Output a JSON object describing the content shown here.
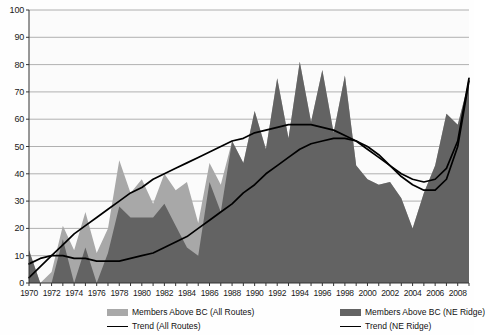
{
  "chart_data": {
    "type": "area",
    "title": "",
    "subtitle": "",
    "xlabel": "",
    "ylabel": "",
    "xlim": [
      1970,
      2009
    ],
    "ylim": [
      0,
      100
    ],
    "ytick_step": 10,
    "grid": true,
    "legend_position": "bottom",
    "yticks": [
      0,
      10,
      20,
      30,
      40,
      50,
      60,
      70,
      80,
      90,
      100
    ],
    "xticks": [
      1970,
      1972,
      1974,
      1976,
      1978,
      1980,
      1982,
      1984,
      1986,
      1988,
      1990,
      1992,
      1994,
      1996,
      1998,
      2000,
      2002,
      2004,
      2006,
      2008
    ],
    "x": [
      1970,
      1971,
      1972,
      1973,
      1974,
      1975,
      1976,
      1977,
      1978,
      1979,
      1980,
      1981,
      1982,
      1983,
      1984,
      1985,
      1986,
      1987,
      1988,
      1989,
      1990,
      1991,
      1992,
      1993,
      1994,
      1995,
      1996,
      1997,
      1998,
      1999,
      2000,
      2001,
      2002,
      2003,
      2004,
      2005,
      2006,
      2007,
      2008,
      2009
    ],
    "series": [
      {
        "name": "Members Above BC (All Routes)",
        "key": "all_routes",
        "color": "#a8a8a8",
        "kind": "area",
        "values": [
          12,
          0,
          4,
          21,
          12,
          26,
          11,
          20,
          45,
          33,
          38,
          29,
          40,
          34,
          37,
          22,
          44,
          36,
          52,
          44,
          63,
          49,
          75,
          53,
          81,
          59,
          78,
          55,
          76,
          43,
          38,
          36,
          37,
          31,
          20,
          33,
          43,
          62,
          58,
          74
        ]
      },
      {
        "name": "Members Above BC (NE Ridge)",
        "key": "ne_ridge",
        "color": "#636363",
        "kind": "area",
        "values": [
          12,
          0,
          0,
          16,
          0,
          13,
          0,
          11,
          28,
          24,
          24,
          24,
          29,
          21,
          13,
          10,
          37,
          26,
          52,
          44,
          63,
          49,
          75,
          53,
          81,
          59,
          78,
          55,
          76,
          43,
          38,
          36,
          37,
          31,
          20,
          33,
          43,
          62,
          58,
          74
        ]
      }
    ],
    "trends": [
      {
        "name": "Trend (All Routes)",
        "key": "trend_all_routes",
        "color": "#000000",
        "kind": "line",
        "values": [
          2,
          6,
          10,
          14,
          18,
          21,
          24,
          27,
          30,
          33,
          35,
          38,
          40,
          42,
          44,
          46,
          48,
          50,
          52,
          53,
          55,
          56,
          57,
          58,
          58,
          58,
          57,
          56,
          54,
          52,
          49,
          46,
          43,
          40,
          38,
          37,
          38,
          42,
          52,
          75
        ]
      },
      {
        "name": "Trend (NE Ridge)",
        "key": "trend_ne_ridge",
        "color": "#000000",
        "kind": "line",
        "values": [
          7,
          9,
          10,
          10,
          9,
          9,
          8,
          8,
          8,
          9,
          10,
          11,
          13,
          15,
          17,
          20,
          23,
          26,
          29,
          33,
          36,
          40,
          43,
          46,
          49,
          51,
          52,
          53,
          53,
          52,
          50,
          47,
          43,
          39,
          36,
          34,
          34,
          38,
          50,
          74
        ]
      }
    ]
  },
  "legend": {
    "items": [
      {
        "label": "Members Above BC (All Routes)",
        "type": "box",
        "color": "#a8a8a8"
      },
      {
        "label": "Members Above BC (NE Ridge)",
        "type": "box",
        "color": "#636363"
      },
      {
        "label": "Trend (All Routes)",
        "type": "line",
        "color": "#000000"
      },
      {
        "label": "Trend (NE Ridge)",
        "type": "line",
        "color": "#000000"
      }
    ]
  },
  "axis": {
    "y_labels": [
      "100",
      "90",
      "80",
      "70",
      "60",
      "50",
      "40",
      "30",
      "20",
      "10",
      "0"
    ],
    "x_labels": [
      "1970",
      "1972",
      "1974",
      "1976",
      "1978",
      "1980",
      "1982",
      "1984",
      "1986",
      "1988",
      "1990",
      "1992",
      "1994",
      "1996",
      "1998",
      "2000",
      "2002",
      "2004",
      "2006",
      "2008"
    ]
  }
}
